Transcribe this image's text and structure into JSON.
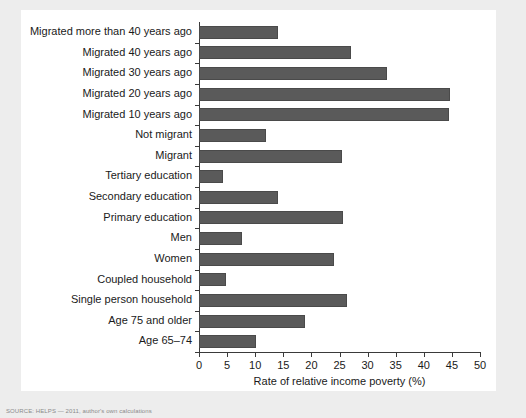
{
  "chart_data": {
    "type": "bar",
    "orientation": "horizontal",
    "title": "",
    "xlabel": "Rate of relative income poverty (%)",
    "ylabel": "",
    "xlim": [
      0,
      50
    ],
    "xticks": [
      0,
      5,
      10,
      15,
      20,
      25,
      30,
      35,
      40,
      45,
      50
    ],
    "grid": false,
    "legend": null,
    "bar_color": "#5a5a5a",
    "panel_color": "#ffffff",
    "background_color": "#ededed",
    "categories": [
      "Migrated more than 40 years ago",
      "Migrated 40 years ago",
      "Migrated 30 years ago",
      "Migrated 20 years ago",
      "Migrated 10 years ago",
      "Not migrant",
      "Migrant",
      "Tertiary education",
      "Secondary education",
      "Primary education",
      "Men",
      "Women",
      "Coupled household",
      "Single person household",
      "Age 75 and older",
      "Age 65–74"
    ],
    "values": [
      14.0,
      27.0,
      33.5,
      44.7,
      44.5,
      12.0,
      25.4,
      4.3,
      14.1,
      25.6,
      7.6,
      24.0,
      4.8,
      26.3,
      18.9,
      10.2
    ]
  },
  "source_note": "SOURCE: HELPS — 2011, author's own calculations"
}
